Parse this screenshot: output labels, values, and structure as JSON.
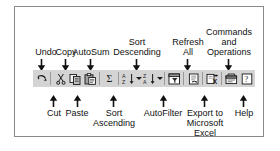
{
  "figure": {
    "kind": "toolbar-callout-diagram",
    "border_color": "#8a8a8a",
    "toolbar_bg": "#d4d4d4",
    "text_color": "#111111"
  },
  "toolbar": {
    "name": "standard-toolbar",
    "buttons": [
      {
        "id": "undo",
        "icon": "undo-icon",
        "label": "Undo",
        "has_dropdown": false
      },
      {
        "id": "cut",
        "icon": "scissors-icon",
        "label": "Cut",
        "has_dropdown": false
      },
      {
        "id": "copy",
        "icon": "copy-icon",
        "label": "Copy",
        "has_dropdown": false
      },
      {
        "id": "paste",
        "icon": "clipboard-paste-icon",
        "label": "Paste",
        "has_dropdown": false
      },
      {
        "id": "autosum",
        "icon": "sigma-icon",
        "label": "AutoSum",
        "has_dropdown": false
      },
      {
        "id": "sort-ascending",
        "icon": "sort-az-icon",
        "label": "Sort Ascending",
        "has_dropdown": true
      },
      {
        "id": "sort-descending",
        "icon": "sort-za-icon",
        "label": "Sort Descending",
        "has_dropdown": true
      },
      {
        "id": "autofilter",
        "icon": "funnel-filter-icon",
        "label": "AutoFilter",
        "has_dropdown": false
      },
      {
        "id": "refresh-all",
        "icon": "refresh-all-icon",
        "label": "Refresh All",
        "has_dropdown": false
      },
      {
        "id": "export-excel",
        "icon": "export-excel-icon",
        "label": "Export to Microsoft Excel",
        "has_dropdown": false
      },
      {
        "id": "commands",
        "icon": "commands-operations-icon",
        "label": "Commands and Operations",
        "has_dropdown": false
      },
      {
        "id": "help",
        "icon": "question-mark-icon",
        "label": "Help",
        "has_dropdown": false
      }
    ]
  },
  "callouts": {
    "above": [
      {
        "target": "undo",
        "lines": [
          "Undo"
        ]
      },
      {
        "target": "copy",
        "lines": [
          "Copy"
        ]
      },
      {
        "target": "autosum",
        "lines": [
          "AutoSum"
        ]
      },
      {
        "target": "sort-descending",
        "lines": [
          "Sort",
          "Descending"
        ]
      },
      {
        "target": "refresh-all",
        "lines": [
          "Refresh",
          "All"
        ]
      },
      {
        "target": "commands",
        "lines": [
          "Commands",
          "and",
          "Operations"
        ]
      }
    ],
    "below": [
      {
        "target": "cut",
        "lines": [
          "Cut"
        ]
      },
      {
        "target": "paste",
        "lines": [
          "Paste"
        ]
      },
      {
        "target": "sort-ascending",
        "lines": [
          "Sort",
          "Ascending"
        ]
      },
      {
        "target": "autofilter",
        "lines": [
          "AutoFilter"
        ]
      },
      {
        "target": "export-excel",
        "lines": [
          "Export to",
          "Microsoft",
          "Excel"
        ]
      },
      {
        "target": "help",
        "lines": [
          "Help"
        ]
      }
    ]
  }
}
